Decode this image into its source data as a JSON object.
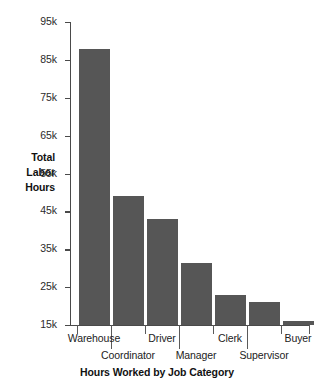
{
  "chart_data": {
    "type": "bar",
    "title": "",
    "xlabel": "Hours Worked by Job Category",
    "ylabel": "Total Labor Hours",
    "ylabel_lines": [
      "Total",
      "Labor",
      "Hours"
    ],
    "categories": [
      "Warehouse",
      "Coordinator",
      "Driver",
      "Manager",
      "Clerk",
      "Supervisor",
      "Buyer"
    ],
    "values": [
      88000,
      49000,
      43000,
      31500,
      23000,
      21000,
      16000
    ],
    "value_labels": [
      "88k",
      "49k",
      "43k",
      "31.5k",
      "23k",
      "21k",
      "16k"
    ],
    "ylim": [
      15000,
      95000
    ],
    "ytick_labels": [
      "95k",
      "85k",
      "75k",
      "65k",
      "55k",
      "45k",
      "35k",
      "25k",
      "15k"
    ],
    "ytick_values": [
      95000,
      85000,
      75000,
      65000,
      55000,
      45000,
      35000,
      25000,
      15000
    ],
    "grid": false,
    "legend": "none",
    "bar_color": "#565656",
    "axis_color": "#4a4a4a",
    "text_color": "#1a1a1a",
    "background": "#ffffff"
  }
}
